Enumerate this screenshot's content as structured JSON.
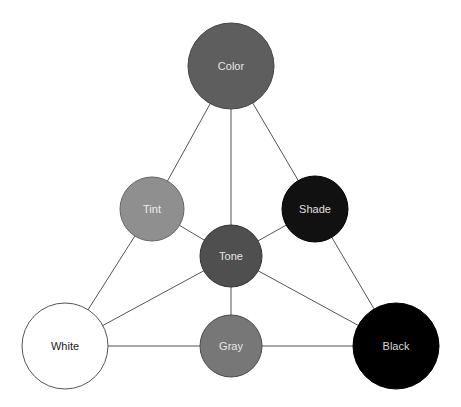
{
  "diagram": {
    "nodes": [
      {
        "id": "color",
        "label": "Color",
        "cx": 231,
        "cy": 66,
        "r": 43,
        "fill": "#5e5e5e",
        "stroke": "#444444",
        "text": "#e6e6e6"
      },
      {
        "id": "tint",
        "label": "Tint",
        "cx": 152,
        "cy": 209,
        "r": 32,
        "fill": "#8f8f8f",
        "stroke": "#666666",
        "text": "#eeeeee"
      },
      {
        "id": "shade",
        "label": "Shade",
        "cx": 315,
        "cy": 209,
        "r": 33,
        "fill": "#111111",
        "stroke": "#000000",
        "text": "#e0e0e0"
      },
      {
        "id": "tone",
        "label": "Tone",
        "cx": 231,
        "cy": 256,
        "r": 31,
        "fill": "#4f4f4f",
        "stroke": "#333333",
        "text": "#e6e6e6"
      },
      {
        "id": "white",
        "label": "White",
        "cx": 65,
        "cy": 346,
        "r": 43,
        "fill": "#ffffff",
        "stroke": "#555555",
        "text": "#222222"
      },
      {
        "id": "gray",
        "label": "Gray",
        "cx": 231,
        "cy": 346,
        "r": 31,
        "fill": "#777777",
        "stroke": "#4a4a4a",
        "text": "#e6e6e6"
      },
      {
        "id": "black",
        "label": "Black",
        "cx": 396,
        "cy": 346,
        "r": 43,
        "fill": "#000000",
        "stroke": "#000000",
        "text": "#d8d8d8"
      }
    ],
    "edges": [
      [
        "color",
        "tint"
      ],
      [
        "color",
        "tone"
      ],
      [
        "color",
        "shade"
      ],
      [
        "tint",
        "white"
      ],
      [
        "tint",
        "tone"
      ],
      [
        "shade",
        "black"
      ],
      [
        "shade",
        "tone"
      ],
      [
        "tone",
        "white"
      ],
      [
        "tone",
        "gray"
      ],
      [
        "tone",
        "black"
      ],
      [
        "white",
        "gray"
      ],
      [
        "gray",
        "black"
      ]
    ],
    "line_color": "#555555"
  }
}
